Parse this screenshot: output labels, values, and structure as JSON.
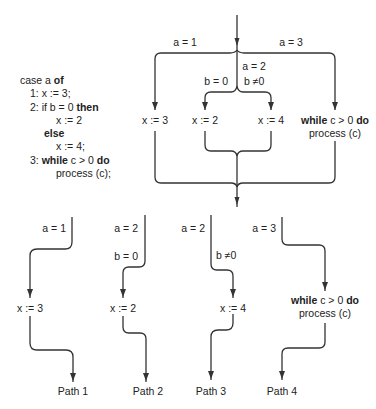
{
  "code": {
    "lines": [
      {
        "indent": 0,
        "parts": [
          {
            "t": "case a "
          },
          {
            "t": "of",
            "kw": true
          }
        ]
      },
      {
        "indent": 1,
        "parts": [
          {
            "t": "1: x := 3;"
          }
        ]
      },
      {
        "indent": 1,
        "parts": [
          {
            "t": "2: if b = 0 "
          },
          {
            "t": "then",
            "kw": true
          }
        ]
      },
      {
        "indent": 3,
        "parts": [
          {
            "t": "x := 2"
          }
        ]
      },
      {
        "indent": 2,
        "parts": [
          {
            "t": "else",
            "kw": true
          }
        ]
      },
      {
        "indent": 3,
        "parts": [
          {
            "t": "x := 4;"
          }
        ]
      },
      {
        "indent": 1,
        "parts": [
          {
            "t": "3: "
          },
          {
            "t": "while",
            "kw": true
          },
          {
            "t": " c > 0 "
          },
          {
            "t": "do",
            "kw": true
          }
        ]
      },
      {
        "indent": 3,
        "parts": [
          {
            "t": "process (c);"
          }
        ]
      }
    ]
  },
  "flow": {
    "labels": {
      "a1": "a = 1",
      "a2": "a = 2",
      "a3": "a = 3",
      "b0": "b = 0",
      "bne0": "b ≠0",
      "x3": "x := 3",
      "x2": "x := 2",
      "x4": "x := 4",
      "while_kw": "while",
      "while_cond": " c > 0 ",
      "do_kw": "do",
      "process": "process (c)"
    }
  },
  "paths": [
    {
      "name": "Path 1",
      "conditions": [
        "a = 1"
      ],
      "statement": [
        "x := 3"
      ]
    },
    {
      "name": "Path 2",
      "conditions": [
        "a = 2",
        "b = 0"
      ],
      "statement": [
        "x := 2"
      ]
    },
    {
      "name": "Path 3",
      "conditions": [
        "a = 2",
        "b ≠0"
      ],
      "statement": [
        "x := 4"
      ]
    },
    {
      "name": "Path 4",
      "conditions": [
        "a = 3"
      ],
      "statement_kw": {
        "while": "while",
        "cond": " c > 0 ",
        "do": "do"
      },
      "statement": [
        "process (c)"
      ]
    }
  ]
}
